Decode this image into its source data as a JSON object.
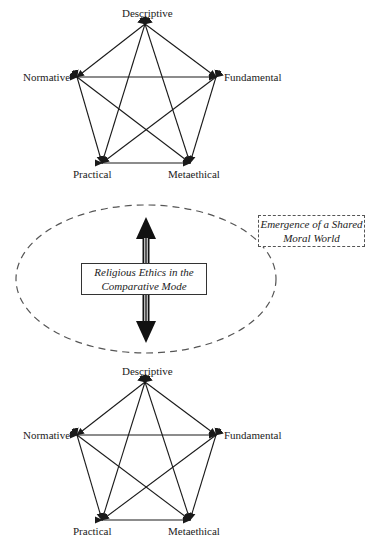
{
  "diagram": {
    "pentagon_top": {
      "nodes": {
        "top": "Descriptive",
        "left": "Normative",
        "right": "Fundamental",
        "bottom_left": "Practical",
        "bottom_right": "Metaethical"
      }
    },
    "center_box": {
      "line1": "Religious Ethics in the",
      "line2": "Comparative Mode"
    },
    "emergence_box": {
      "line1": "Emergence of a Shared",
      "line2": "Moral World"
    },
    "pentagon_bottom": {
      "nodes": {
        "top": "Descriptive",
        "left": "Normative",
        "right": "Fundamental",
        "bottom_left": "Practical",
        "bottom_right": "Metaethical"
      }
    },
    "colors": {
      "line": "#1a1a1a",
      "dash": "#555555",
      "background": "#ffffff"
    }
  }
}
